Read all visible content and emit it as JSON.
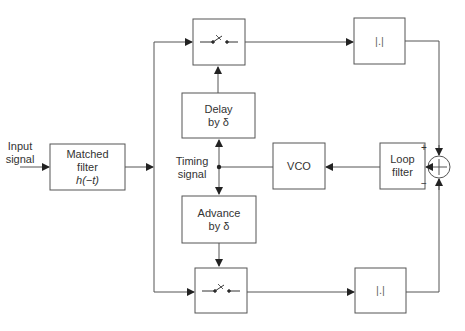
{
  "diagram": {
    "type": "block-diagram",
    "input_label": [
      "Input",
      "signal"
    ],
    "blocks": {
      "matched_filter": {
        "line1": "Matched",
        "line2": "filter",
        "line3": "h(−t)"
      },
      "delay": {
        "line1": "Delay",
        "line2": "by δ"
      },
      "advance": {
        "line1": "Advance",
        "line2": "by δ"
      },
      "vco": {
        "label": "VCO"
      },
      "loop_filter": {
        "line1": "Loop",
        "line2": "filter"
      },
      "abs_top": {
        "label": "|.|"
      },
      "abs_bottom": {
        "label": "|.|"
      },
      "sampler_top": {
        "label": "switch"
      },
      "sampler_bottom": {
        "label": "switch"
      }
    },
    "timing_label": [
      "Timing",
      "signal"
    ],
    "summer": {
      "plus_sign": "+",
      "minus_sign": "−",
      "symbol": "+"
    },
    "colors": {
      "line": "#444444",
      "box_stroke": "#666666",
      "background": "#ffffff"
    }
  }
}
